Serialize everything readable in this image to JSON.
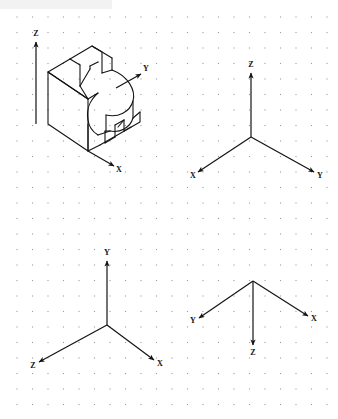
{
  "page": {
    "background_color": "#ffffff",
    "ink_color": "#141414",
    "grid": {
      "dot_color": "#9a9aa8",
      "spacing_px": 15.5,
      "origin_x": 17,
      "origin_y": 17,
      "columns": 21,
      "rows": 26,
      "visible": true
    },
    "top_band": {
      "color": "#f2f2f2",
      "width": 112,
      "height": 9
    }
  },
  "figures": [
    {
      "id": "figure-1",
      "name": "isometric-object-with-axes",
      "description": "Isometric pictorial of a bracket with V-notch, cylindrical face and rectangular slot, shown with Z up, Y upper-right, X lower-right",
      "origin": {
        "x": 36,
        "y": 124
      },
      "axes": [
        {
          "label": "Z",
          "direction": "up",
          "label_x": 36,
          "label_y": 36,
          "tip_x": 36,
          "tip_y": 42,
          "tail_x": 36,
          "tail_y": 124
        },
        {
          "label": "Y",
          "direction": "upper-right",
          "label_x": 146,
          "label_y": 71,
          "tip_x": 141,
          "tip_y": 74,
          "tail_x": 116,
          "tail_y": 88
        },
        {
          "label": "X",
          "direction": "lower-right",
          "label_x": 119,
          "label_y": 172,
          "tip_x": 114,
          "tip_y": 166,
          "tail_x": 88,
          "tail_y": 151
        }
      ]
    },
    {
      "id": "figure-2",
      "name": "axes-z-up-x-left-y-right",
      "description": "Isometric axis triad: Z vertical up, X to lower-left, Y to lower-right",
      "origin": {
        "x": 251,
        "y": 137
      },
      "axes": [
        {
          "label": "Z",
          "direction": "up",
          "label_x": 251,
          "label_y": 67,
          "tip_x": 251,
          "tip_y": 73,
          "tail_x": 251,
          "tail_y": 137
        },
        {
          "label": "X",
          "direction": "lower-left",
          "label_x": 193,
          "label_y": 178,
          "tip_x": 198,
          "tip_y": 172,
          "tail_x": 251,
          "tail_y": 137
        },
        {
          "label": "Y",
          "direction": "lower-right",
          "label_x": 320,
          "label_y": 178,
          "tip_x": 314,
          "tip_y": 172,
          "tail_x": 251,
          "tail_y": 137
        }
      ]
    },
    {
      "id": "figure-3",
      "name": "axes-y-up-z-left-x-right",
      "description": "Isometric axis triad: Y vertical up, Z to lower-left, X to lower-right",
      "origin": {
        "x": 107,
        "y": 325
      },
      "axes": [
        {
          "label": "Y",
          "direction": "up",
          "label_x": 107,
          "label_y": 255,
          "tip_x": 107,
          "tip_y": 261,
          "tail_x": 107,
          "tail_y": 325
        },
        {
          "label": "Z",
          "direction": "lower-left",
          "label_x": 33,
          "label_y": 368,
          "tip_x": 39,
          "tip_y": 362,
          "tail_x": 107,
          "tail_y": 325
        },
        {
          "label": "X",
          "direction": "lower-right",
          "label_x": 160,
          "label_y": 366,
          "tip_x": 154,
          "tip_y": 360,
          "tail_x": 107,
          "tail_y": 325
        }
      ]
    },
    {
      "id": "figure-4",
      "name": "axes-z-down-y-left-x-right",
      "description": "Isometric axis triad: Z vertical down, Y to upper-left, X to upper-right",
      "origin": {
        "x": 253,
        "y": 281
      },
      "axes": [
        {
          "label": "Z",
          "direction": "down",
          "label_x": 253,
          "label_y": 355,
          "tip_x": 253,
          "tip_y": 345,
          "tail_x": 253,
          "tail_y": 281
        },
        {
          "label": "Y",
          "direction": "upper-left",
          "label_x": 193,
          "label_y": 323,
          "tip_x": 199,
          "tip_y": 318,
          "tail_x": 253,
          "tail_y": 281
        },
        {
          "label": "X",
          "direction": "upper-right",
          "label_x": 314,
          "label_y": 321,
          "tip_x": 308,
          "tip_y": 316,
          "tail_x": 253,
          "tail_y": 281
        }
      ]
    }
  ],
  "object_geometry": {
    "name": "bracket-isometric-outline",
    "stroke_color": "#141414",
    "stroke_width": 1.1,
    "notes": "Closed polyline outlines plus two circular-arc faces approximating the cylindrical boss and the concave fillet"
  }
}
